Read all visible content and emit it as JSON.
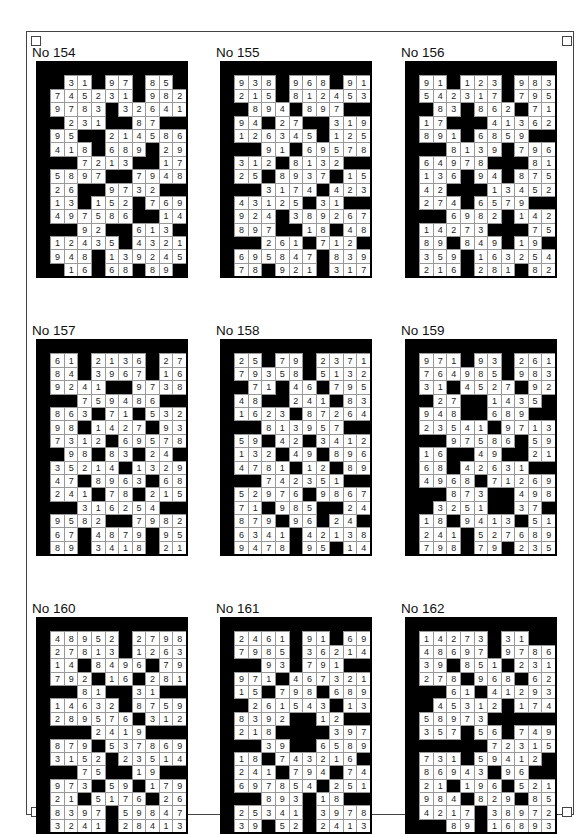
{
  "page": {
    "puzzles": [
      {
        "title": "No 154",
        "rows": [
          "#31#97#85#",
          "7452 31#982",
          "9783#32641",
          "#231##87##",
          "95##214586",
          "418#689#29",
          "##7213##17",
          "5897##7948",
          "26##9732##",
          "13#152#769",
          "497586##14",
          "##92##613#",
          "12435#4321",
          "948#139245",
          "#16#68#89#"
        ]
      },
      {
        "title": "No 155",
        "rows": [
          "938#968#91",
          "215#812453",
          "#894#897##",
          "94#27##319",
          "126345#125",
          "##91#69578",
          "312#8132##",
          "25#8937#15",
          "##3174#423",
          "43125#31##",
          "924#389267",
          "897##18#48",
          "##261#712#",
          "695847#839",
          "78#921#317"
        ]
      },
      {
        "title": "No 156",
        "rows": [
          "91#123#983",
          "542317#795",
          "#83#862#71",
          "17###41362",
          "891#6859##",
          "##8139#796",
          "64978###81",
          "136#94#875",
          "42###13452",
          "274#6579##",
          "##6982#142",
          "14273###75",
          "89#849#19#",
          "359#163254",
          "216#281#82"
        ]
      },
      {
        "title": "No 157",
        "rows": [
          "61#2136#27",
          "84#3967#16",
          "9241##9738",
          "##759486##",
          "863#71#532",
          "98#1427#93",
          "7312#69578",
          "#98#83#24#",
          "35214#1329",
          "47#8963#68",
          "241#78#215",
          "##316254##",
          "9582##7982",
          "67#4879#95",
          "89#3418#21"
        ]
      },
      {
        "title": "No 158",
        "rows": [
          "25#79#2371",
          "79358#5132",
          "#71#46#795",
          "48##241#83",
          "1623#87264",
          "##813957##",
          "59#42#3412",
          "132#49#896",
          "4781#12#89",
          "##742351##",
          "52976#9867",
          "71#985##24",
          "879#96#24#",
          "6341#42138",
          "9478#95#14"
        ]
      },
      {
        "title": "No 159",
        "rows": [
          "971#93#261",
          "764985#983",
          "31#4527#92",
          "#27##1435#",
          "948##689##",
          "23541#9713",
          "##97586#59",
          "16##49##21",
          "68#42631##",
          "4968#71269",
          "##873##498",
          "#3251##37#",
          "18#9413#51",
          "241#527689",
          "798#79#235"
        ]
      },
      {
        "title": "No 160",
        "rows": [
          "48952#2798",
          "27813#1263",
          "14#8496#79",
          "792#16#281",
          "##81##31##",
          "14632#8759",
          "289576#312",
          "###2419###",
          "879#537869",
          "3152#23514",
          "##75##19##",
          "973#59#179",
          "21#5176#26",
          "8397#59847",
          "3241#28413"
        ]
      },
      {
        "title": "No 161",
        "rows": [
          "2461#91#69",
          "7985#36214",
          "##93#791##",
          "971#467321",
          "15#798#689",
          "#261543#13",
          "8392##12##",
          "218####397",
          "##39##6589",
          "18#743216#",
          "241#794#74",
          "697854#251",
          "##893#18##",
          "25341#3978",
          "39#52#2413"
        ]
      },
      {
        "title": "No 162",
        "rows": [
          "14273#31##",
          "48697#9786",
          "39#851#231",
          "278#968#62",
          "##61#41293",
          "#45312#174",
          "58973#####",
          "357#56#749",
          "#####72315",
          "731#59412#",
          "86943#96##",
          "21#196#521",
          "984#829#85",
          "4217#38972",
          "##89#16893"
        ]
      }
    ]
  }
}
